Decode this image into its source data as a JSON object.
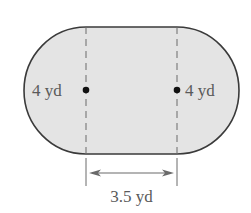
{
  "figure": {
    "shape": "stadium (rectangle with semicircular ends)",
    "fill_color": "#e4e4e4",
    "outline_color": "#3a3a3a",
    "label_color": "#5a5a5a"
  },
  "labels": {
    "left_radius": "4 yd",
    "right_radius": "4 yd",
    "center_distance": "3.5 yd"
  }
}
